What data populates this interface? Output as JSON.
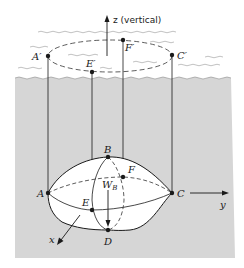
{
  "figure": {
    "colors": {
      "water": "#d6d6d6",
      "background": "#ffffff",
      "ink": "#1a1a1a",
      "body_fill": "#ffffff"
    },
    "axes": {
      "z": {
        "label": "z (vertical)"
      },
      "y": {
        "label": "y"
      },
      "x": {
        "label": "x"
      }
    },
    "surface_points": [
      {
        "id": "A_prime",
        "label": "A′"
      },
      {
        "id": "E_prime",
        "label": "E′"
      },
      {
        "id": "F_prime",
        "label": "F′"
      },
      {
        "id": "C_prime",
        "label": "C′"
      }
    ],
    "body_points": [
      {
        "id": "A",
        "label": "A"
      },
      {
        "id": "B",
        "label": "B"
      },
      {
        "id": "C",
        "label": "C"
      },
      {
        "id": "D",
        "label": "D"
      },
      {
        "id": "E",
        "label": "E"
      },
      {
        "id": "F",
        "label": "F"
      }
    ],
    "weight": {
      "symbol": "W",
      "subscript": "B"
    }
  }
}
